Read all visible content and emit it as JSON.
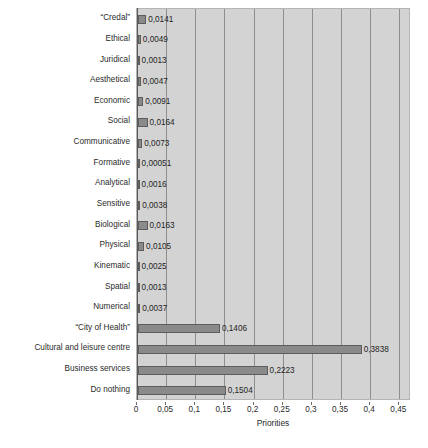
{
  "chart_data": {
    "type": "bar",
    "orientation": "horizontal",
    "title": "",
    "xlabel": "Priorities",
    "ylabel": "",
    "xlim": [
      0,
      0.47
    ],
    "grid": true,
    "legend": null,
    "xticks": [
      0,
      0.05,
      0.1,
      0.15,
      0.2,
      0.25,
      0.3,
      0.35,
      0.4,
      0.45
    ],
    "xticklabels": [
      "0",
      "0,05",
      "0,1",
      "0,15",
      "0,2",
      "0,25",
      "0,3",
      "0,35",
      "0,4",
      "0,45"
    ],
    "categories": [
      "“Credal”",
      "Ethical",
      "Juridical",
      "Aesthetical",
      "Economic",
      "Social",
      "Communicative",
      "Formative",
      "Analytical",
      "Sensitive",
      "Biological",
      "Physical",
      "Kinematic",
      "Spatial",
      "Numerical",
      "“City of Health”",
      "Cultural and leisure centre",
      "Business services",
      "Do nothing"
    ],
    "values": [
      0.0141,
      0.0049,
      0.0013,
      0.0047,
      0.0091,
      0.0164,
      0.0073,
      0.00051,
      0.0016,
      0.0038,
      0.0163,
      0.0105,
      0.0025,
      0.0013,
      0.0037,
      0.1406,
      0.3838,
      0.2223,
      0.1504
    ],
    "datalabels": [
      "0,0141",
      "0,0049",
      "0,0013",
      "0,0047",
      "0,0091",
      "0,0164",
      "0,0073",
      "0,00051",
      "0,0016",
      "0,0038",
      "0,0163",
      "0,0105",
      "0,0025",
      "0,0013",
      "0,0037",
      "0,1406",
      "0,3838",
      "0,2223",
      "0,1504"
    ],
    "colors": {
      "plot_background": "#d3d3d3",
      "bar_fill": "#8a8a8a",
      "bar_edge": "#5d5d5d",
      "gridline": "#8d8d8d",
      "text": "#2b2b2b",
      "figure_background": "#ffffff"
    }
  }
}
